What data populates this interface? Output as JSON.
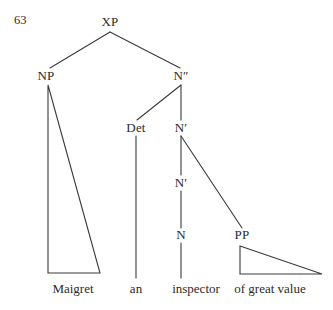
{
  "figure": {
    "example_number": "63",
    "background_color": "#ffffff",
    "ink_color": "#2b2b2b",
    "line_color": "#3a3a3a",
    "width": 333,
    "height": 310
  },
  "nodes": {
    "xp": {
      "label": "XP",
      "x": 110,
      "y": 22
    },
    "np": {
      "label": "NP",
      "x": 46,
      "y": 76
    },
    "n2": {
      "label": "N″",
      "x": 181,
      "y": 76
    },
    "det": {
      "label": "Det",
      "x": 136,
      "y": 128
    },
    "n1_upper": {
      "label": "N′",
      "x": 181,
      "y": 128
    },
    "n1_lower": {
      "label": "N′",
      "x": 181,
      "y": 183
    },
    "n_head": {
      "label": "N",
      "x": 181,
      "y": 235
    },
    "pp": {
      "label": "PP",
      "x": 242,
      "y": 235
    }
  },
  "terminals": {
    "maigret": {
      "label": "Maigret",
      "x": 73,
      "y": 289
    },
    "an": {
      "label": "an",
      "x": 136,
      "y": 289
    },
    "inspector": {
      "label": "inspector",
      "x": 196,
      "y": 289
    },
    "of_great_value": {
      "label": "of great value",
      "x": 270,
      "y": 289
    }
  },
  "triangles": {
    "np_triangle": {
      "name": "np-triangle",
      "apex": [
        48,
        85
      ],
      "base_left": [
        48,
        273
      ],
      "base_right": [
        100,
        273
      ],
      "points": "48,85 48,273 100,273"
    },
    "pp_triangle": {
      "name": "pp-triangle",
      "apex": [
        240,
        246
      ],
      "base_left": [
        240,
        274
      ],
      "base_right": [
        322,
        274
      ],
      "points": "240,246 240,274 322,274"
    }
  },
  "edges": [
    {
      "name": "xp-to-np",
      "from": "XP",
      "to": "NP",
      "x1": 110,
      "y1": 32,
      "x2": 50,
      "y2": 68
    },
    {
      "name": "xp-to-n2",
      "from": "XP",
      "to": "N″",
      "x1": 110,
      "y1": 32,
      "x2": 180,
      "y2": 68
    },
    {
      "name": "n2-to-det",
      "from": "N″",
      "to": "Det",
      "x1": 181,
      "y1": 85,
      "x2": 137,
      "y2": 120
    },
    {
      "name": "n2-to-n1",
      "from": "N″",
      "to": "N′",
      "x1": 181,
      "y1": 85,
      "x2": 181,
      "y2": 120
    },
    {
      "name": "det-to-an",
      "from": "Det",
      "to": "an",
      "x1": 136,
      "y1": 136,
      "x2": 136,
      "y2": 278
    },
    {
      "name": "n1-to-n1",
      "from": "N′",
      "to": "N′",
      "x1": 181,
      "y1": 136,
      "x2": 181,
      "y2": 175
    },
    {
      "name": "n1-to-pp",
      "from": "N′",
      "to": "PP",
      "x1": 181,
      "y1": 136,
      "x2": 242,
      "y2": 228
    },
    {
      "name": "n1-to-n",
      "from": "N′",
      "to": "N",
      "x1": 181,
      "y1": 191,
      "x2": 181,
      "y2": 228
    },
    {
      "name": "n-to-inspector",
      "from": "N",
      "to": "inspector",
      "x1": 181,
      "y1": 243,
      "x2": 181,
      "y2": 278
    }
  ],
  "caption": {
    "sentence": "Maigret an inspector of great value"
  }
}
